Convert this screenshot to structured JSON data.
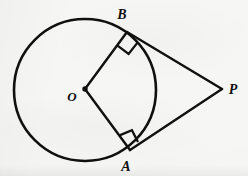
{
  "figure": {
    "background_color": "#f6f6f4",
    "stroke_color": "#101010",
    "canvas": {
      "width": 248,
      "height": 176
    }
  },
  "labels": {
    "center": "O",
    "tangent_point_upper": "B",
    "tangent_point_lower": "A",
    "external_point": "P"
  },
  "geometry": {
    "circle": {
      "cx": 85,
      "cy": 90,
      "r": 71,
      "stroke_width": 2.6
    },
    "center_dot": {
      "cx": 85,
      "cy": 89,
      "r": 2.6
    },
    "points": {
      "O": {
        "x": 85,
        "y": 89
      },
      "B": {
        "x": 127,
        "y": 32
      },
      "A": {
        "x": 130,
        "y": 150
      },
      "P": {
        "x": 222,
        "y": 89
      }
    },
    "segments": [
      {
        "name": "radius-OB",
        "from": "O",
        "to": "B",
        "stroke_width": 2.4
      },
      {
        "name": "radius-OA",
        "from": "O",
        "to": "A",
        "stroke_width": 2.4
      },
      {
        "name": "tangent-BP",
        "from": "B",
        "to": "P",
        "stroke_width": 2.4
      },
      {
        "name": "tangent-AP",
        "from": "A",
        "to": "P",
        "stroke_width": 2.4
      }
    ],
    "right_angle_markers": [
      {
        "name": "right-angle-at-B",
        "vertex": "B",
        "size": 15,
        "angle_label": "90"
      },
      {
        "name": "right-angle-at-A",
        "vertex": "A",
        "size": 15,
        "angle_label": "90"
      }
    ]
  },
  "label_positions": {
    "O": {
      "x": 72,
      "y": 101,
      "font_size": 13
    },
    "B": {
      "x": 118,
      "y": 19,
      "font_size": 14
    },
    "A": {
      "x": 121,
      "y": 170,
      "font_size": 14
    },
    "P": {
      "x": 229,
      "y": 94,
      "font_size": 14
    }
  }
}
